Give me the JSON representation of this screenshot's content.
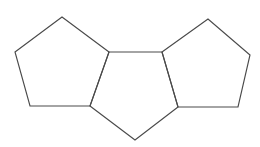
{
  "figure": {
    "background_color": "#ffffff",
    "stroke_color": "#4a4a4a",
    "fill_color": "#ffffff",
    "stroke_width": 1.15,
    "canvas": {
      "width": 260,
      "height": 147
    },
    "ring_count": 3,
    "vertex_count": 11,
    "shared_edge_count": 2
  },
  "vertices": {
    "left_apex": {
      "label": "left-apex",
      "x": 62,
      "y": 17
    },
    "left_west": {
      "label": "left-west",
      "x": 15,
      "y": 52
    },
    "left_southwest": {
      "label": "left-southwest",
      "x": 30,
      "y": 106
    },
    "top_junction_left": {
      "label": "top-junction-left",
      "x": 109,
      "y": 52
    },
    "top_junction_right": {
      "label": "top-junction-right",
      "x": 162,
      "y": 52
    },
    "bottom_junction_left": {
      "label": "bottom-junction-left",
      "x": 90,
      "y": 106
    },
    "bottom_junction_right": {
      "label": "bottom-junction-right",
      "x": 178,
      "y": 107
    },
    "bottom_apex": {
      "label": "bottom-apex",
      "x": 135,
      "y": 140
    },
    "right_apex": {
      "label": "right-apex",
      "x": 208,
      "y": 19
    },
    "right_east": {
      "label": "right-east",
      "x": 250,
      "y": 55
    },
    "right_southeast": {
      "label": "right-southeast",
      "x": 238,
      "y": 107
    }
  },
  "rings": {
    "left": {
      "name": "left-pentagon",
      "sides": 5,
      "points": "15,52 62,17 109,52 90,106 30,106"
    },
    "center": {
      "name": "center-pentagon",
      "sides": 5,
      "points": "109,52 162,52 178,107 135,140 90,106"
    },
    "right": {
      "name": "right-pentagon",
      "sides": 5,
      "points": "162,52 208,19 250,55 238,107 178,107"
    }
  },
  "chart_data": {
    "type": "diagram",
    "shapes": [
      {
        "name": "left-pentagon",
        "type": "polygon",
        "sides": 5,
        "vertices": [
          [
            15,
            52
          ],
          [
            62,
            17
          ],
          [
            109,
            52
          ],
          [
            90,
            106
          ],
          [
            30,
            106
          ]
        ]
      },
      {
        "name": "center-pentagon",
        "type": "polygon",
        "sides": 5,
        "vertices": [
          [
            109,
            52
          ],
          [
            162,
            52
          ],
          [
            178,
            107
          ],
          [
            135,
            140
          ],
          [
            90,
            106
          ]
        ]
      },
      {
        "name": "right-pentagon",
        "type": "polygon",
        "sides": 5,
        "vertices": [
          [
            162,
            52
          ],
          [
            208,
            19
          ],
          [
            250,
            55
          ],
          [
            238,
            107
          ],
          [
            178,
            107
          ]
        ]
      }
    ],
    "shared_edges": [
      {
        "name": "left-center-shared-edge",
        "from": [
          109,
          52
        ],
        "to": [
          90,
          106
        ]
      },
      {
        "name": "center-right-shared-edge",
        "from": [
          162,
          52
        ],
        "to": [
          178,
          107
        ]
      }
    ],
    "legend": [],
    "grid": false,
    "xlabel": "",
    "ylabel": ""
  }
}
